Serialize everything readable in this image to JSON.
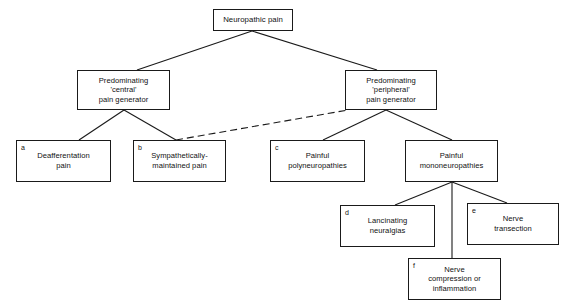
{
  "diagram": {
    "stroke_color": "#1a1a1a",
    "background_color": "#ffffff",
    "nodes": [
      {
        "id": "root",
        "tag": "",
        "label": "Neuropathic pain"
      },
      {
        "id": "central",
        "tag": "",
        "label": "Predominating\n'central'\npain generator"
      },
      {
        "id": "peripheral",
        "tag": "",
        "label": "Predominating\n'peripheral'\npain generator"
      },
      {
        "id": "a",
        "tag": "a",
        "label": "Deafferentation\npain"
      },
      {
        "id": "b",
        "tag": "b",
        "label": "Sympathetically-\nmaintained pain"
      },
      {
        "id": "c",
        "tag": "c",
        "label": "Painful\npolyneuropathies"
      },
      {
        "id": "mono",
        "tag": "",
        "label": "Painful\nmononeuropathies"
      },
      {
        "id": "d",
        "tag": "d",
        "label": "Lancinating\nneuralgias"
      },
      {
        "id": "e",
        "tag": "e",
        "label": "Nerve\ntransection"
      },
      {
        "id": "f",
        "tag": "f",
        "label": "Nerve\ncompression or\ninflammation"
      }
    ],
    "edges": [
      {
        "from": "root",
        "to": "central",
        "style": "solid"
      },
      {
        "from": "root",
        "to": "peripheral",
        "style": "solid"
      },
      {
        "from": "central",
        "to": "a",
        "style": "solid"
      },
      {
        "from": "central",
        "to": "b",
        "style": "solid"
      },
      {
        "from": "peripheral",
        "to": "b",
        "style": "dashed"
      },
      {
        "from": "peripheral",
        "to": "c",
        "style": "solid"
      },
      {
        "from": "peripheral",
        "to": "mono",
        "style": "solid"
      },
      {
        "from": "mono",
        "to": "d",
        "style": "solid"
      },
      {
        "from": "mono",
        "to": "e",
        "style": "solid"
      },
      {
        "from": "mono",
        "to": "f",
        "style": "solid"
      }
    ]
  }
}
